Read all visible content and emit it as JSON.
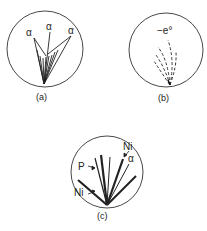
{
  "figure": {
    "panels": [
      {
        "id": "a",
        "caption": "(a)",
        "labels": [
          "α",
          "α",
          "α"
        ]
      },
      {
        "id": "b",
        "caption": "(b)",
        "labels": [
          "−e°"
        ]
      },
      {
        "id": "c",
        "caption": "(c)",
        "labels": [
          "Ni",
          "α",
          "P",
          "Ni"
        ]
      }
    ]
  }
}
